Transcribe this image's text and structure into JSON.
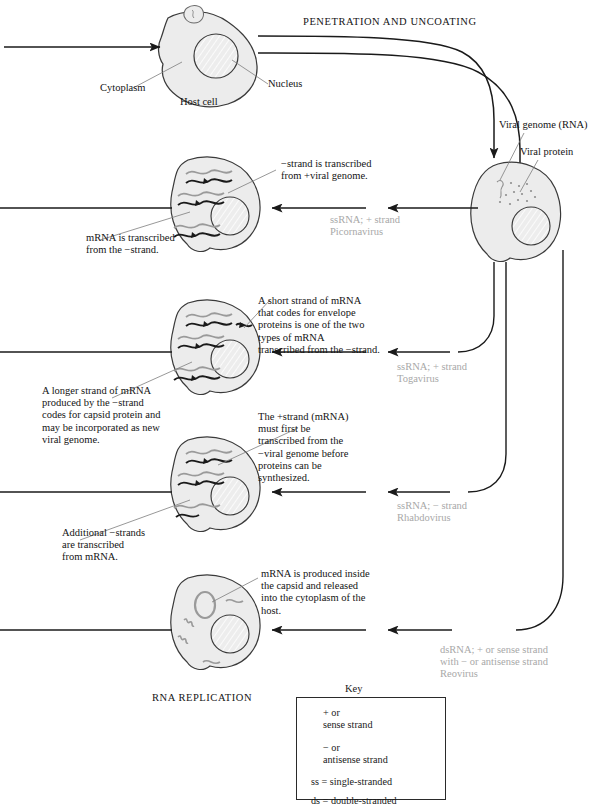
{
  "figure": {
    "top_process_label": "PENETRATION AND UNCOATING",
    "bottom_process_label": "RNA REPLICATION"
  },
  "host_cell": {
    "label": "Host cell",
    "cytoplasm_label": "Cytoplasm",
    "nucleus_label": "Nucleus"
  },
  "infected_cell": {
    "viral_genome_label": "Viral genome (RNA)",
    "viral_protein_label": "Viral protein"
  },
  "pathways": [
    {
      "id": "picornavirus",
      "virus_label": "ssRNA; + strand\nPicornavirus",
      "annotations": [
        "−strand is transcribed\nfrom +viral genome.",
        "mRNA is transcribed\nfrom the −strand."
      ]
    },
    {
      "id": "togavirus",
      "virus_label": "ssRNA; + strand\nTogavirus",
      "annotations": [
        "A short strand of mRNA\nthat codes for envelope\nproteins is one of the two\ntypes of mRNA\ntranscribed from the −strand.",
        "A longer strand of mRNA\nproduced by the −strand\ncodes for capsid protein and\nmay be incorporated as new\nviral genome."
      ]
    },
    {
      "id": "rhabdovirus",
      "virus_label": "ssRNA; − strand\nRhabdovirus",
      "annotations": [
        "The +strand (mRNA)\nmust  first be\ntranscribed from the\n−viral  genome before\nproteins can be\nsynthesized.",
        "Additional −strands\nare transcribed\nfrom mRNA."
      ]
    },
    {
      "id": "reovirus",
      "virus_label": "dsRNA; + or sense strand\nwith − or antisense strand\nReovirus",
      "annotations": [
        "mRNA is produced inside\nthe capsid and released\ninto the cytoplasm of the\nhost."
      ]
    }
  ],
  "key": {
    "title": "Key",
    "entries": [
      {
        "glyph": "sense-strand-squiggle",
        "text": "+ or\nsense strand"
      },
      {
        "glyph": "antisense-strand-squiggle",
        "text": "− or\nantisense strand"
      }
    ],
    "abbreviations": [
      "ss = single-stranded",
      "ds = double-stranded"
    ]
  },
  "colors": {
    "ink": "#1a1a1a",
    "cell_fill": "#ececec",
    "cell_stroke": "#3a3a3a",
    "gray_text": "#a8a8a8",
    "sense_strand": "#9a9a9a",
    "antisense_strand": "#1a1a1a"
  }
}
